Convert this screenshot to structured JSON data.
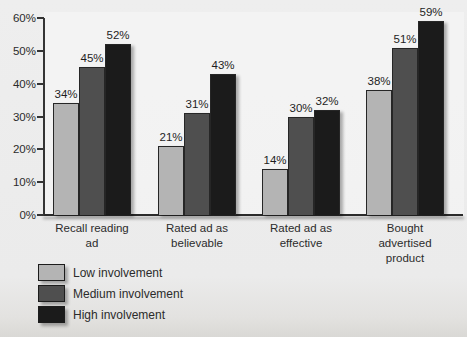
{
  "chart_data": {
    "type": "bar",
    "title": "",
    "categories": [
      "Recall reading ad",
      "Rated ad as believable",
      "Rated ad as effective",
      "Bought advertised product"
    ],
    "series": [
      {
        "name": "Low involvement",
        "color": "#b4b4b4",
        "values": [
          34,
          21,
          14,
          38
        ]
      },
      {
        "name": "Medium involvement",
        "color": "#4f4f4f",
        "values": [
          45,
          31,
          30,
          51
        ]
      },
      {
        "name": "High involvement",
        "color": "#1b1b1b",
        "values": [
          52,
          43,
          32,
          59
        ]
      }
    ],
    "value_label_suffix": "%",
    "xlabel": "",
    "ylabel": "",
    "ylim": [
      0,
      60
    ],
    "y_tick_values": [
      0,
      10,
      20,
      30,
      40,
      50,
      60
    ],
    "y_tick_labels": [
      "0%",
      "10%",
      "20%",
      "30%",
      "40%",
      "50%",
      "60%"
    ],
    "grid": false,
    "legend_position": "bottom-left"
  }
}
